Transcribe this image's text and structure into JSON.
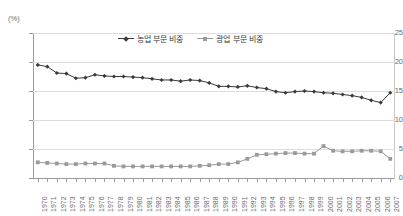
{
  "chart_data": {
    "type": "line",
    "title": "",
    "subtitle": "",
    "xlabel": "",
    "ylabel": "",
    "unit_label": "(%)",
    "grid": true,
    "legend_position": "top-center",
    "ylim": [
      0,
      25
    ],
    "yticks": [
      0,
      5,
      10,
      15,
      20,
      25
    ],
    "ytick_labels": [
      "0",
      "5",
      "10",
      "15",
      "20",
      "25"
    ],
    "x": [
      "1970",
      "1971",
      "1972",
      "1973",
      "1974",
      "1975",
      "1976",
      "1977",
      "1978",
      "1979",
      "1980",
      "1981",
      "1982",
      "1983",
      "1984",
      "1985",
      "1986",
      "1987",
      "1988",
      "1989",
      "1990",
      "1991",
      "1992",
      "1993",
      "1994",
      "1995",
      "1996",
      "1997",
      "1998",
      "1999",
      "2000",
      "2001",
      "2002",
      "2003",
      "2004",
      "2005",
      "2006",
      "2007"
    ],
    "series": [
      {
        "name": "농업 부문 비중",
        "color": "#3a3a3a",
        "marker": "diamond",
        "values": [
          19.5,
          19.2,
          18.1,
          18.0,
          17.2,
          17.3,
          17.8,
          17.6,
          17.5,
          17.5,
          17.4,
          17.3,
          17.1,
          16.9,
          16.9,
          16.7,
          16.9,
          16.8,
          16.4,
          15.8,
          15.8,
          15.7,
          15.9,
          15.6,
          15.4,
          14.9,
          14.7,
          14.9,
          15.0,
          14.9,
          14.7,
          14.6,
          14.4,
          14.2,
          13.9,
          13.4,
          13.0,
          14.7
        ]
      },
      {
        "name": "광업 부문 비중",
        "color": "#9a9a9a",
        "marker": "square",
        "values": [
          2.7,
          2.6,
          2.5,
          2.4,
          2.4,
          2.5,
          2.5,
          2.5,
          2.1,
          2.0,
          2.0,
          2.0,
          2.0,
          2.0,
          2.0,
          2.0,
          2.0,
          2.1,
          2.2,
          2.4,
          2.4,
          2.7,
          3.3,
          4.0,
          4.1,
          4.2,
          4.3,
          4.3,
          4.2,
          4.2,
          5.5,
          4.7,
          4.6,
          4.6,
          4.7,
          4.7,
          4.6,
          3.3
        ]
      }
    ]
  }
}
